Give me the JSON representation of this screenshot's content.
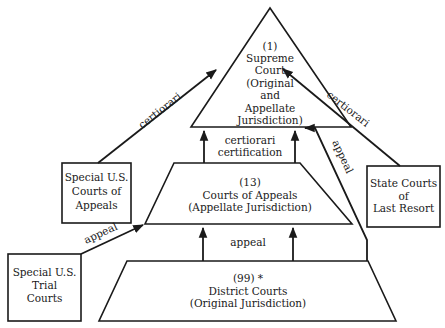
{
  "diagram": {
    "type": "hierarchy",
    "title": "",
    "nodes": {
      "supreme": {
        "line1": "(1)",
        "line2": "Supreme",
        "line3": "Court",
        "line4": "(Original",
        "line5": "and",
        "line6": "Appellate",
        "line7": "Jurisdiction)"
      },
      "appeals": {
        "line1": "(13)",
        "line2": "Courts of Appeals",
        "line3": "(Appellate Jurisdiction)"
      },
      "district": {
        "line1": "(99) *",
        "line2": "District Courts",
        "line3": "(Original Jurisdiction)"
      },
      "special_appeals": {
        "line1": "Special U.S.",
        "line2": "Courts of",
        "line3": "Appeals"
      },
      "state_courts": {
        "line1": "State Courts",
        "line2": "of",
        "line3": "Last Resort"
      },
      "special_trial": {
        "line1": "Special U.S.",
        "line2": "Trial",
        "line3": "Courts"
      }
    },
    "edges": {
      "cert_certification": {
        "line1": "certiorari",
        "line2": "certification"
      },
      "district_to_appeals": "appeal",
      "special_appeals_to_supreme": "certiorari",
      "state_to_supreme": "certiorari",
      "district_to_supreme": "appeal",
      "trial_to_appeals": "appeal"
    }
  }
}
